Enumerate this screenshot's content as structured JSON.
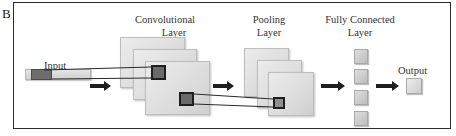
{
  "panel": {
    "letter": "B"
  },
  "labels": {
    "conv_line1": "Convolutional",
    "conv_line2": "Layer",
    "pool_line1": "Pooling",
    "pool_line2": "Layer",
    "fc_line1": "Fully Connected",
    "fc_line2": "Layer",
    "input": "Input",
    "output": "Output"
  },
  "diagram": {
    "type": "CNN architecture",
    "stages": [
      "Input",
      "Convolutional Layer",
      "Pooling Layer",
      "Fully Connected Layer",
      "Output"
    ],
    "conv_feature_maps": 3,
    "pool_feature_maps": 3,
    "fc_units": 4,
    "output_units": 1
  }
}
